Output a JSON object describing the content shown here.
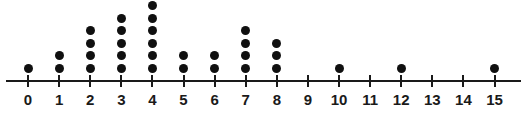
{
  "chart_data": {
    "type": "dotplot",
    "title": "",
    "subtitle": "",
    "xlabel": "",
    "ylabel": "",
    "grid": false,
    "legend": "none",
    "xlim": [
      0,
      15
    ],
    "categories": [
      "0",
      "1",
      "2",
      "3",
      "4",
      "5",
      "6",
      "7",
      "8",
      "9",
      "10",
      "11",
      "12",
      "13",
      "14",
      "15"
    ],
    "values": [
      1,
      2,
      4,
      5,
      6,
      2,
      2,
      4,
      3,
      0,
      1,
      0,
      1,
      0,
      0,
      1
    ],
    "points": [
      {
        "x": "0",
        "count": 1
      },
      {
        "x": "1",
        "count": 2
      },
      {
        "x": "2",
        "count": 4
      },
      {
        "x": "3",
        "count": 5
      },
      {
        "x": "4",
        "count": 6
      },
      {
        "x": "5",
        "count": 2
      },
      {
        "x": "6",
        "count": 2
      },
      {
        "x": "7",
        "count": 4
      },
      {
        "x": "8",
        "count": 3
      },
      {
        "x": "9",
        "count": 0
      },
      {
        "x": "10",
        "count": 1
      },
      {
        "x": "11",
        "count": 0
      },
      {
        "x": "12",
        "count": 1
      },
      {
        "x": "13",
        "count": 0
      },
      {
        "x": "14",
        "count": 0
      },
      {
        "x": "15",
        "count": 1
      }
    ],
    "total_dots": 28,
    "colors": {
      "dot": "#101010",
      "axis": "#1a1a1a",
      "label": "#1a1a1a",
      "background": "#ffffff"
    }
  },
  "axis": {
    "labels": [
      "0",
      "1",
      "2",
      "3",
      "4",
      "5",
      "6",
      "7",
      "8",
      "9",
      "10",
      "11",
      "12",
      "13",
      "14",
      "15"
    ]
  }
}
